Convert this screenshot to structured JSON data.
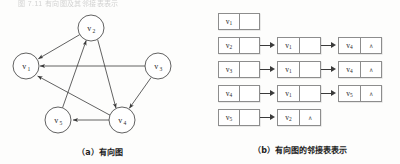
{
  "figure": {
    "scan_top_line": "图 7.11 有向图及其邻接表表示",
    "caption_a": "（a）有向图",
    "caption_b": "（b）有向图的邻接表表示"
  },
  "colors": {
    "ink": "#2b2b2b",
    "line": "#3a3a3a",
    "box_border": "#8d8d8d",
    "paper": "#fdfdfc"
  },
  "graph": {
    "type": "directed-graph",
    "nodes": [
      {
        "id": "v1",
        "label": "v",
        "sub": "1",
        "cx": 26,
        "cy": 58,
        "r": 13
      },
      {
        "id": "v2",
        "label": "v",
        "sub": "2",
        "cx": 91,
        "cy": 20,
        "r": 13
      },
      {
        "id": "v3",
        "label": "v",
        "sub": "3",
        "cx": 158,
        "cy": 58,
        "r": 13
      },
      {
        "id": "v4",
        "label": "v",
        "sub": "4",
        "cx": 122,
        "cy": 112,
        "r": 13
      },
      {
        "id": "v5",
        "label": "v",
        "sub": "5",
        "cx": 58,
        "cy": 112,
        "r": 13
      }
    ],
    "edges": [
      {
        "from": "v2",
        "to": "v1"
      },
      {
        "from": "v2",
        "to": "v4"
      },
      {
        "from": "v3",
        "to": "v1"
      },
      {
        "from": "v3",
        "to": "v4"
      },
      {
        "from": "v4",
        "to": "v1"
      },
      {
        "from": "v4",
        "to": "v5"
      },
      {
        "from": "v5",
        "to": "v2"
      }
    ]
  },
  "adjacency_list": {
    "nil_marker": "∧",
    "rows": [
      {
        "head": {
          "label": "v",
          "sub": "1"
        },
        "nodes": []
      },
      {
        "head": {
          "label": "v",
          "sub": "2"
        },
        "nodes": [
          {
            "label": "v",
            "sub": "1",
            "nil": false
          },
          {
            "label": "v",
            "sub": "4",
            "nil": true
          }
        ]
      },
      {
        "head": {
          "label": "v",
          "sub": "3"
        },
        "nodes": [
          {
            "label": "v",
            "sub": "1",
            "nil": false
          },
          {
            "label": "v",
            "sub": "4",
            "nil": true
          }
        ]
      },
      {
        "head": {
          "label": "v",
          "sub": "4"
        },
        "nodes": [
          {
            "label": "v",
            "sub": "1",
            "nil": false
          },
          {
            "label": "v",
            "sub": "5",
            "nil": true
          }
        ]
      },
      {
        "head": {
          "label": "v",
          "sub": "5"
        },
        "nodes": [
          {
            "label": "v",
            "sub": "2",
            "nil": true
          }
        ]
      }
    ]
  }
}
